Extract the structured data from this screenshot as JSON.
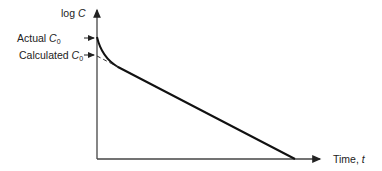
{
  "diagram": {
    "type": "semilog-decay-plot",
    "y_axis": {
      "label_prefix": "log ",
      "label_var": "C"
    },
    "x_axis": {
      "label_prefix": "Time, ",
      "label_var": "t"
    },
    "markers": [
      {
        "label_prefix": "Actual ",
        "label_var": "C",
        "label_sub": "0"
      },
      {
        "label_prefix": "Calculated ",
        "label_var": "C",
        "label_sub": "0"
      }
    ],
    "curves": [
      {
        "name": "actual-curve",
        "style": "solid",
        "description": "curved initial decay merging into linear terminal phase"
      },
      {
        "name": "extrapolated-line",
        "style": "dashed",
        "description": "back-extrapolation of linear phase to y-axis"
      }
    ],
    "colors": {
      "ink": "#222222",
      "background": "#ffffff"
    }
  }
}
